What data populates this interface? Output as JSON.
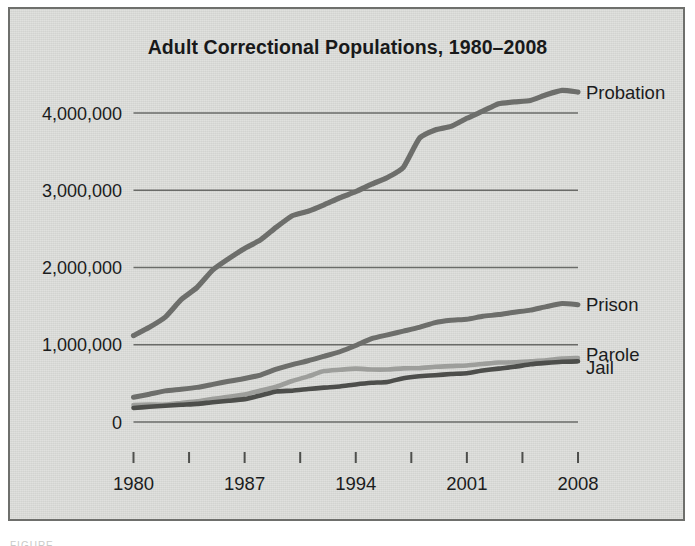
{
  "figure": {
    "background_color": "#d9dad7",
    "border_color": "#6e6f6c",
    "caption_sliver": "FIGURE"
  },
  "chart_data": {
    "type": "line",
    "title": "Adult Correctional Populations, 1980–2008",
    "xlabel": "",
    "ylabel": "",
    "xlim": [
      1980,
      2008
    ],
    "ylim": [
      0,
      4400000
    ],
    "grid": true,
    "gridlines_y": [
      0,
      1000000,
      2000000,
      3000000,
      4000000
    ],
    "legend_position": "right-inline-labels",
    "y_tick_labels": [
      "0",
      "1,000,000",
      "2,000,000",
      "3,000,000",
      "4,000,000"
    ],
    "y_tick_values": [
      0,
      1000000,
      2000000,
      3000000,
      4000000
    ],
    "x_tick_labels": [
      "1980",
      "1987",
      "1994",
      "2001",
      "2008"
    ],
    "x_tick_values": [
      1980,
      1987,
      1994,
      2001,
      2008
    ],
    "x_minor_tick_values": [
      1980,
      1983.5,
      1987,
      1990.5,
      1994,
      1997.5,
      2001,
      2004.5,
      2008
    ],
    "x": [
      1980,
      1981,
      1982,
      1983,
      1984,
      1985,
      1986,
      1987,
      1988,
      1989,
      1990,
      1991,
      1992,
      1993,
      1994,
      1995,
      1996,
      1997,
      1998,
      1999,
      2000,
      2001,
      2002,
      2003,
      2004,
      2005,
      2006,
      2007,
      2008
    ],
    "series": [
      {
        "name": "Probation",
        "color": "#6d6e6b",
        "values": [
          1118097,
          1225934,
          1357264,
          1582947,
          1740948,
          1968712,
          2114621,
          2247158,
          2356483,
          2522125,
          2670234,
          2728472,
          2811611,
          2903061,
          2981022,
          3077861,
          3164996,
          3296513,
          3670441,
          3779922,
          3826209,
          3931731,
          4024067,
          4120012,
          4143792,
          4162536,
          4236800,
          4293163,
          4270917
        ]
      },
      {
        "name": "Prison",
        "color": "#6d6e6b",
        "values": [
          319598,
          360029,
          402914,
          423898,
          448264,
          487593,
          526436,
          562814,
          607766,
          683367,
          743382,
          792535,
          850566,
          909381,
          990147,
          1078542,
          1127528,
          1176564,
          1224469,
          1287172,
          1316333,
          1330007,
          1367856,
          1390279,
          1421345,
          1448344,
          1492973,
          1532817,
          1518559
        ]
      },
      {
        "name": "Parole",
        "color": "#9d9e9b",
        "values": [
          220438,
          225539,
          224604,
          246440,
          266992,
          300203,
          325638,
          355505,
          407977,
          456803,
          531407,
          590442,
          658601,
          676100,
          690371,
          679421,
          679733,
          694787,
          696385,
          714457,
          723898,
          732333,
          750934,
          769925,
          771852,
          784408,
          798202,
          821177,
          828169
        ]
      },
      {
        "name": "Jail",
        "color": "#4d4e4b",
        "values": [
          182288,
          196785,
          209582,
          223551,
          234500,
          256615,
          274444,
          295873,
          343569,
          395553,
          405320,
          426479,
          444584,
          459804,
          486474,
          507044,
          518492,
          567079,
          592462,
          605943,
          621149,
          631240,
          665475,
          691301,
          713990,
          747529,
          765819,
          780174,
          785556
        ]
      }
    ],
    "series_labels": [
      {
        "name": "Probation",
        "label_y_value": 4270000
      },
      {
        "name": "Prison",
        "label_y_value": 1520000
      },
      {
        "name": "Parole",
        "label_y_value": 880000
      },
      {
        "name": "Jail",
        "label_y_value": 700000
      }
    ]
  }
}
